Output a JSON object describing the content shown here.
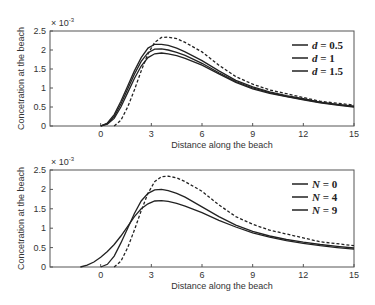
{
  "chart_data": [
    {
      "type": "line",
      "title": "",
      "xlabel": "Distance along the beach",
      "ylabel": "Concetration at the beach",
      "y_multiplier": "× 10",
      "y_exponent": "-3",
      "xlim": [
        -3,
        15
      ],
      "ylim": [
        0,
        2.5
      ],
      "xticks": [
        0,
        3,
        6,
        9,
        12,
        15
      ],
      "yticks": [
        0,
        0.5,
        1,
        1.5,
        2,
        2.5
      ],
      "ytick_labels": [
        "0",
        "0.5",
        "1",
        "1.5",
        "2",
        "2.5"
      ],
      "grid": false,
      "legend_position": "top-right",
      "legend": [
        {
          "var": "d",
          "text": " = 0.5"
        },
        {
          "var": "d",
          "text": " = 1"
        },
        {
          "var": "d",
          "text": " = 1.5"
        }
      ],
      "series": [
        {
          "name": "reference",
          "style": "dashed",
          "x": [
            0.8,
            1.2,
            1.6,
            2,
            2.4,
            2.8,
            3.2,
            3.6,
            4,
            4.5,
            5,
            6,
            7,
            8,
            9,
            10,
            11,
            12,
            13,
            14,
            15
          ],
          "y": [
            0,
            0.15,
            0.5,
            0.95,
            1.45,
            1.9,
            2.2,
            2.33,
            2.34,
            2.3,
            2.2,
            1.95,
            1.6,
            1.3,
            1.1,
            0.95,
            0.85,
            0.75,
            0.65,
            0.6,
            0.55
          ]
        },
        {
          "name": "d = 0.5",
          "style": "solid",
          "x": [
            0,
            0.4,
            0.8,
            1.2,
            1.6,
            2,
            2.4,
            2.8,
            3.2,
            3.6,
            4,
            4.5,
            5,
            6,
            7,
            8,
            9,
            10,
            11,
            12,
            13,
            14,
            15
          ],
          "y": [
            0,
            0.08,
            0.3,
            0.65,
            1.05,
            1.45,
            1.8,
            2.05,
            2.15,
            2.15,
            2.12,
            2.05,
            1.95,
            1.72,
            1.45,
            1.2,
            1.03,
            0.9,
            0.8,
            0.72,
            0.63,
            0.57,
            0.52
          ]
        },
        {
          "name": "d = 1",
          "style": "solid",
          "x": [
            0,
            0.4,
            0.8,
            1.2,
            1.6,
            2,
            2.4,
            2.8,
            3.2,
            3.6,
            4,
            4.5,
            5,
            6,
            7,
            8,
            9,
            10,
            11,
            12,
            13,
            14,
            15
          ],
          "y": [
            0,
            0.06,
            0.25,
            0.58,
            0.97,
            1.36,
            1.7,
            1.93,
            2.02,
            2.03,
            2.0,
            1.94,
            1.86,
            1.65,
            1.4,
            1.17,
            1.0,
            0.88,
            0.78,
            0.7,
            0.62,
            0.56,
            0.51
          ]
        },
        {
          "name": "d = 1.5",
          "style": "solid",
          "x": [
            0,
            0.4,
            0.8,
            1.2,
            1.6,
            2,
            2.4,
            2.8,
            3.2,
            3.6,
            4,
            4.5,
            5,
            6,
            7,
            8,
            9,
            10,
            11,
            12,
            13,
            14,
            15
          ],
          "y": [
            0,
            0.05,
            0.2,
            0.5,
            0.88,
            1.25,
            1.58,
            1.8,
            1.9,
            1.92,
            1.9,
            1.85,
            1.78,
            1.6,
            1.37,
            1.15,
            0.98,
            0.86,
            0.77,
            0.69,
            0.61,
            0.55,
            0.5
          ]
        }
      ]
    },
    {
      "type": "line",
      "title": "",
      "xlabel": "Distance along the beach",
      "ylabel": "Concetration at the beach",
      "y_multiplier": "× 10",
      "y_exponent": "-3",
      "xlim": [
        -3,
        15
      ],
      "ylim": [
        0,
        2.5
      ],
      "xticks": [
        0,
        3,
        6,
        9,
        12,
        15
      ],
      "yticks": [
        0,
        0.5,
        1,
        1.5,
        2,
        2.5
      ],
      "ytick_labels": [
        "0",
        "0.5",
        "1",
        "1.5",
        "2",
        "2.5"
      ],
      "grid": false,
      "legend_position": "top-right",
      "legend": [
        {
          "var": "N",
          "text": " = 0"
        },
        {
          "var": "N",
          "text": " = 4"
        },
        {
          "var": "N",
          "text": " = 9"
        }
      ],
      "series": [
        {
          "name": "N = 0",
          "style": "dashed",
          "x": [
            0.8,
            1.2,
            1.6,
            2,
            2.4,
            2.8,
            3.2,
            3.6,
            4,
            4.5,
            5,
            6,
            7,
            8,
            9,
            10,
            11,
            12,
            13,
            14,
            15
          ],
          "y": [
            0,
            0.15,
            0.5,
            0.95,
            1.45,
            1.9,
            2.2,
            2.33,
            2.34,
            2.3,
            2.2,
            1.95,
            1.6,
            1.3,
            1.1,
            0.95,
            0.85,
            0.75,
            0.65,
            0.6,
            0.55
          ]
        },
        {
          "name": "N = 4",
          "style": "solid",
          "x": [
            0,
            0.4,
            0.8,
            1.2,
            1.6,
            2,
            2.4,
            2.8,
            3.2,
            3.6,
            4,
            4.5,
            5,
            6,
            7,
            8,
            9,
            10,
            11,
            12,
            13,
            14,
            15
          ],
          "y": [
            0,
            0.07,
            0.28,
            0.62,
            1.0,
            1.38,
            1.7,
            1.9,
            1.99,
            2.0,
            1.97,
            1.9,
            1.8,
            1.55,
            1.3,
            1.08,
            0.92,
            0.8,
            0.71,
            0.64,
            0.58,
            0.53,
            0.49
          ]
        },
        {
          "name": "N = 9",
          "style": "solid",
          "x": [
            -1.2,
            -0.8,
            -0.4,
            0,
            0.4,
            0.8,
            1.2,
            1.6,
            2,
            2.4,
            2.8,
            3.2,
            3.6,
            4,
            4.5,
            5,
            6,
            7,
            8,
            9,
            10,
            11,
            12,
            13,
            14,
            15
          ],
          "y": [
            0,
            0.05,
            0.13,
            0.25,
            0.4,
            0.58,
            0.8,
            1.05,
            1.3,
            1.5,
            1.63,
            1.7,
            1.71,
            1.69,
            1.64,
            1.57,
            1.4,
            1.2,
            1.03,
            0.88,
            0.77,
            0.68,
            0.61,
            0.55,
            0.5,
            0.46
          ]
        }
      ]
    }
  ]
}
